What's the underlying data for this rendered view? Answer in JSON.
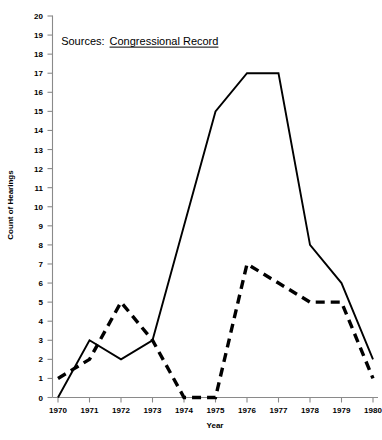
{
  "chart_data": {
    "type": "line",
    "title": "",
    "xlabel": "Year",
    "ylabel": "Count of Hearings",
    "x": [
      1970,
      1971,
      1972,
      1973,
      1974,
      1975,
      1976,
      1977,
      1978,
      1979,
      1980
    ],
    "xtick_labels": [
      "1970",
      "1971",
      "1972",
      "1973",
      "1974",
      "1975",
      "1976",
      "1977",
      "1978",
      "1979",
      "1980"
    ],
    "ytick_labels": [
      "0",
      "1",
      "2",
      "3",
      "4",
      "5",
      "6",
      "7",
      "8",
      "9",
      "10",
      "11",
      "12",
      "13",
      "14",
      "15",
      "16",
      "17",
      "18",
      "19",
      "20"
    ],
    "xlim": [
      1970,
      1980
    ],
    "ylim": [
      0,
      20
    ],
    "grid": false,
    "legend": "none",
    "series": [
      {
        "name": "solid-series",
        "style": "solid",
        "color": "#000000",
        "values": [
          0,
          3,
          2,
          3,
          9,
          15,
          17,
          17,
          8,
          6,
          2
        ]
      },
      {
        "name": "dashed-series",
        "style": "dashed",
        "color": "#000000",
        "values": [
          1,
          2,
          5,
          3,
          0,
          0,
          7,
          6,
          5,
          5,
          1
        ]
      }
    ],
    "annotations": [
      {
        "name": "sources-note",
        "prefix": "Sources:",
        "underlined_text": "Congressional Record",
        "x_value": 1970.1,
        "y_value": 18.5
      }
    ]
  }
}
